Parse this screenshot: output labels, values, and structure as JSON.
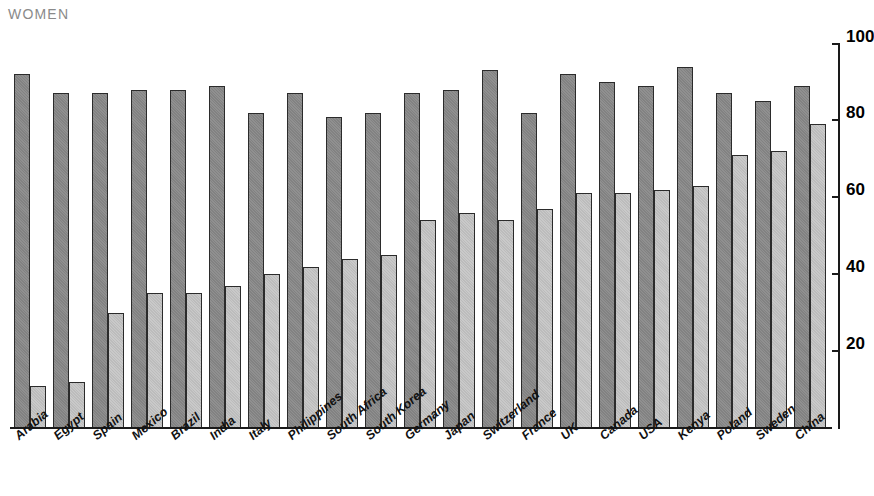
{
  "header": {
    "title": "WOMEN"
  },
  "axis": {
    "y_ticks": [
      100,
      80,
      60,
      40,
      20
    ],
    "y_tick_labels": [
      "100",
      "80",
      "60",
      "40",
      "20"
    ]
  },
  "colors": {
    "dark_bar": "#8a8a8a",
    "light_bar": "#c6c6c6",
    "bar_outline": "#2b2b2b",
    "axis": "#1a1a1a",
    "title": "#8a8a8a",
    "background": "#ffffff"
  },
  "chart_data": {
    "type": "bar",
    "title": "WOMEN",
    "xlabel": "",
    "ylabel": "",
    "ylim": [
      0,
      100
    ],
    "grid": false,
    "legend_position": "none",
    "categories": [
      "Arabia",
      "Egypt",
      "Spain",
      "Mexico",
      "Brazil",
      "India",
      "Italy",
      "Philippines",
      "South Africa",
      "South Korea",
      "Germany",
      "Japan",
      "Switzerland",
      "France",
      "UK",
      "Canada",
      "USA",
      "Kenya",
      "Poland",
      "Sweden",
      "China"
    ],
    "series": [
      {
        "name": "dark",
        "values": [
          92,
          87,
          87,
          88,
          88,
          89,
          82,
          87,
          81,
          82,
          87,
          88,
          93,
          82,
          92,
          90,
          89,
          94,
          87,
          85,
          89
        ]
      },
      {
        "name": "light",
        "values": [
          11,
          12,
          30,
          35,
          35,
          37,
          40,
          42,
          44,
          45,
          54,
          56,
          54,
          57,
          61,
          61,
          62,
          63,
          71,
          72,
          79
        ]
      }
    ]
  }
}
